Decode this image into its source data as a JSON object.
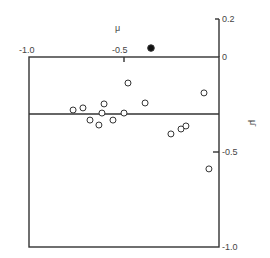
{
  "chart_data": {
    "type": "scatter",
    "title": "",
    "xlabel": "μ",
    "ylabel": "μ̄",
    "xlim": [
      -1.0,
      0
    ],
    "ylim": [
      -1.0,
      0.2
    ],
    "x_ticks": [
      "-1.0",
      "-0.5"
    ],
    "y_ticks": [
      "0.2",
      "0",
      "-0.5",
      "-1.0"
    ],
    "grid": false,
    "reference_line": {
      "y": -0.3
    },
    "series": [
      {
        "name": "open",
        "marker": "open-circle",
        "points": [
          [
            -0.768,
            -0.279
          ],
          [
            -0.716,
            -0.268
          ],
          [
            -0.605,
            -0.247
          ],
          [
            -0.616,
            -0.295
          ],
          [
            -0.679,
            -0.332
          ],
          [
            -0.632,
            -0.358
          ],
          [
            -0.558,
            -0.332
          ],
          [
            -0.479,
            -0.137
          ],
          [
            -0.5,
            -0.295
          ],
          [
            -0.389,
            -0.242
          ],
          [
            -0.253,
            -0.405
          ],
          [
            -0.2,
            -0.379
          ],
          [
            -0.174,
            -0.363
          ],
          [
            -0.079,
            -0.189
          ],
          [
            -0.053,
            -0.589
          ]
        ]
      },
      {
        "name": "filled",
        "marker": "filled-circle",
        "points": [
          [
            -0.358,
            0.047
          ]
        ]
      }
    ]
  }
}
